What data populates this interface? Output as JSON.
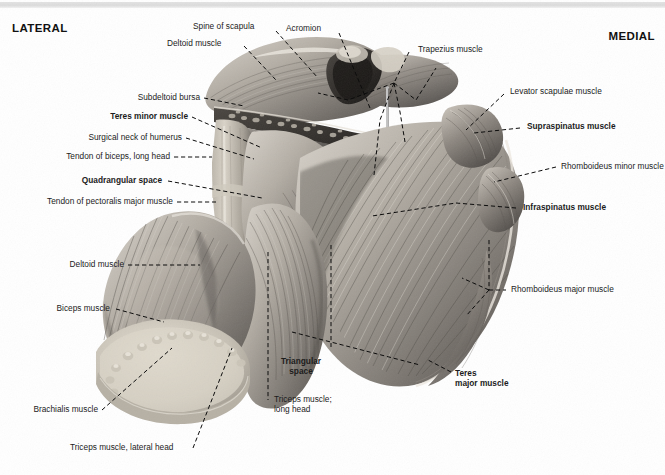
{
  "figure": {
    "type": "anatomical-illustration",
    "rendering": "grayscale cadaveric photograph with dashed leader lines"
  },
  "orientation": {
    "left_label": "LATERAL",
    "right_label": "MEDIAL"
  },
  "labels": [
    {
      "id": "spine-of-scapula",
      "text": "Spine of scapula",
      "bold": false
    },
    {
      "id": "acromion",
      "text": "Acromion",
      "bold": false
    },
    {
      "id": "deltoid-muscle-top",
      "text": "Deltoid muscle",
      "bold": false
    },
    {
      "id": "trapezius-muscle",
      "text": "Trapezius muscle",
      "bold": false
    },
    {
      "id": "levator-scapulae-muscle",
      "text": "Levator scapulae muscle",
      "bold": false
    },
    {
      "id": "supraspinatus-muscle",
      "text": "Supraspinatus muscle",
      "bold": true
    },
    {
      "id": "rhomboideus-minor-muscle",
      "text": "Rhomboideus minor muscle",
      "bold": false
    },
    {
      "id": "infraspinatus-muscle",
      "text": "Infraspinatus muscle",
      "bold": true
    },
    {
      "id": "rhomboideus-major-muscle",
      "text": "Rhomboideus major muscle",
      "bold": false
    },
    {
      "id": "subdeltoid-bursa",
      "text": "Subdeltoid bursa",
      "bold": false
    },
    {
      "id": "teres-minor-muscle",
      "text": "Teres minor muscle",
      "bold": true
    },
    {
      "id": "surgical-neck-of-humerus",
      "text": "Surgical neck of humerus",
      "bold": false
    },
    {
      "id": "tendon-of-biceps-long-head",
      "text": "Tendon of biceps, long head",
      "bold": false
    },
    {
      "id": "quadrangular-space",
      "text": "Quadrangular space",
      "bold": true
    },
    {
      "id": "tendon-of-pectoralis-major",
      "text": "Tendon of pectoralis major muscle",
      "bold": false
    },
    {
      "id": "deltoid-muscle-lower",
      "text": "Deltoid muscle",
      "bold": false
    },
    {
      "id": "biceps-muscle",
      "text": "Biceps muscle",
      "bold": false
    },
    {
      "id": "brachialis-muscle",
      "text": "Brachialis muscle",
      "bold": false
    },
    {
      "id": "triceps-muscle-lateral-head",
      "text": "Triceps muscle, lateral head",
      "bold": false
    },
    {
      "id": "triangular-space-line1",
      "text": "Triangular",
      "bold": true
    },
    {
      "id": "triangular-space-line2",
      "text": "space",
      "bold": true
    },
    {
      "id": "triceps-long-head-line1",
      "text": "Triceps muscle;",
      "bold": false
    },
    {
      "id": "triceps-long-head-line2",
      "text": "long head",
      "bold": false
    },
    {
      "id": "teres-major-line1",
      "text": "Teres",
      "bold": true
    },
    {
      "id": "teres-major-line2",
      "text": "major muscle",
      "bold": true
    }
  ],
  "colors": {
    "background": "#ffffff",
    "text": "#1c1c1c",
    "leader_line": "#0c0c0c",
    "top_strip": "#e0e0e0"
  }
}
